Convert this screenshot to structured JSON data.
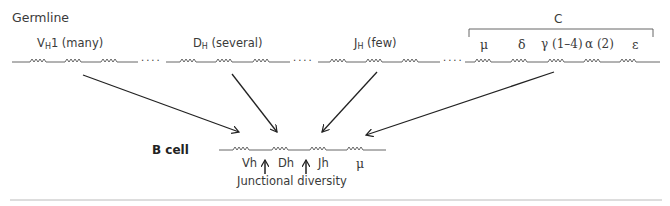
{
  "diagram": {
    "germline": {
      "title": "Germline",
      "segments": {
        "vh": {
          "prefix": "V",
          "sub": "H",
          "suffix": "1 (many)"
        },
        "dh": {
          "prefix": "D",
          "sub": "H",
          "suffix": " (several)"
        },
        "jh": {
          "prefix": "J",
          "sub": "H",
          "suffix": " (few)"
        }
      },
      "dots": "....",
      "constant": {
        "bracket_label": "C",
        "genes": [
          "μ",
          "δ",
          "γ (1–4)",
          "α (2)",
          "ε"
        ]
      }
    },
    "bcell": {
      "title": "B cell",
      "segments": [
        "Vh",
        "Dh",
        "Jh",
        "μ"
      ],
      "annotation": "Junctional diversity"
    },
    "colors": {
      "line": "#555555",
      "arrow": "#222222",
      "text": "#3a3a3a",
      "divider": "#bbbbbb"
    }
  }
}
